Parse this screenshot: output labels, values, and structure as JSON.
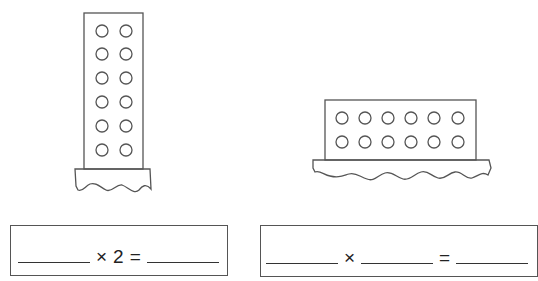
{
  "figures": [
    {
      "name": "tall-brick",
      "columns": 2,
      "rows": 6,
      "stud_count": 12
    },
    {
      "name": "wide-brick",
      "columns": 6,
      "rows": 2,
      "stud_count": 12
    }
  ],
  "equations": [
    {
      "blank1": "",
      "operator": "×",
      "given_factor": "2",
      "equals": "=",
      "result": ""
    },
    {
      "blank1": "",
      "operator": "×",
      "blank2": "",
      "equals": "=",
      "result": ""
    }
  ],
  "colors": {
    "stroke": "#555555",
    "background": "#ffffff"
  }
}
